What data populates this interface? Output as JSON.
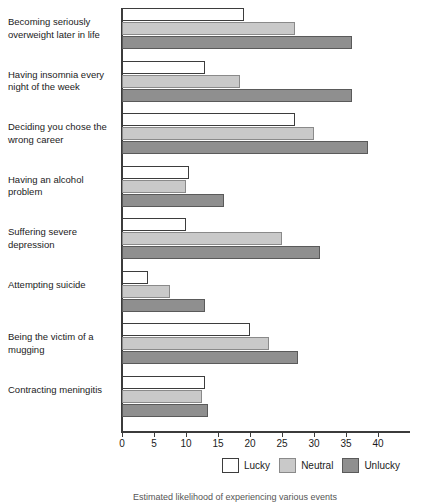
{
  "chart_data": {
    "type": "bar",
    "orientation": "horizontal",
    "title": "",
    "xlabel": "",
    "ylabel": "",
    "xlim": [
      0,
      45
    ],
    "xticks": [
      0,
      5,
      10,
      15,
      20,
      25,
      30,
      35,
      40
    ],
    "grid": false,
    "legend_position": "bottom-right",
    "categories": [
      "Becoming seriously overweight later in life",
      "Having insomnia every night of the week",
      "Deciding you chose the wrong career",
      "Having an alcohol problem",
      "Suffering severe depression",
      "Attempting suicide",
      "Being the victim of a mugging",
      "Contracting meningitis"
    ],
    "series": [
      {
        "name": "Lucky",
        "color": "#ffffff",
        "values": [
          19,
          13,
          27,
          10.5,
          10,
          4,
          20,
          13
        ]
      },
      {
        "name": "Neutral",
        "color": "#c9c9c9",
        "values": [
          27,
          18.5,
          30,
          10,
          25,
          7.5,
          23,
          12.5
        ]
      },
      {
        "name": "Unlucky",
        "color": "#8f8f8f",
        "values": [
          36,
          36,
          38.5,
          16,
          31,
          13,
          27.5,
          13.5
        ]
      }
    ]
  },
  "legend": {
    "items": [
      {
        "label": "Lucky",
        "swatch": "lucky-swatch"
      },
      {
        "label": "Neutral",
        "swatch": "neutral-swatch"
      },
      {
        "label": "Unlucky",
        "swatch": "unlucky-swatch"
      }
    ]
  },
  "caption": "Estimated likelihood of experiencing various events"
}
